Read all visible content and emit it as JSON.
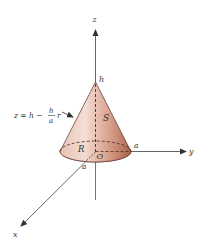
{
  "figure": {
    "type": "3d-solid-cone",
    "axes": {
      "x_label": "x",
      "y_label": "y",
      "z_label": "z"
    },
    "points": {
      "apex_label": "h",
      "origin_label": "O",
      "y_radius_label": "a",
      "x_radius_label": "a"
    },
    "regions": {
      "surface_label": "S",
      "base_label": "R"
    },
    "equation": {
      "lhs": "z = h −",
      "frac_num": "h",
      "frac_den": "a",
      "rhs": "r",
      "full": "z = h − (h/a) r"
    },
    "colors": {
      "cone_light": "#f3ddd4",
      "cone_mid": "#d9a08c",
      "cone_dark": "#a9604a",
      "base_fill": "#dba08d",
      "axis": "#555555",
      "text": "#333333"
    }
  }
}
